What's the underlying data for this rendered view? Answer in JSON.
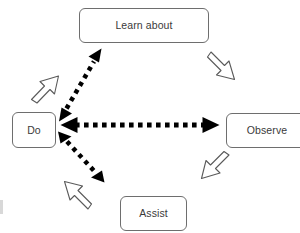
{
  "diagram": {
    "background_color": "#ffffff",
    "node_border_color": "#6e6e6e",
    "node_text_color": "#3a3a3a",
    "outline_arrow_color": "#5a5a5a",
    "dotted_arrow_color": "#000000",
    "nodes": [
      {
        "id": "learn",
        "label": "Learn about"
      },
      {
        "id": "observe",
        "label": "Observe"
      },
      {
        "id": "assist",
        "label": "Assist"
      },
      {
        "id": "do",
        "label": "Do"
      }
    ],
    "outline_arrows": [
      {
        "id": "do-to-learn",
        "from": "Do",
        "to": "Learn about",
        "direction": "up-right",
        "style": "hollow-block-arrow"
      },
      {
        "id": "learn-to-observe",
        "from": "Learn about",
        "to": "Observe",
        "direction": "down-right",
        "style": "hollow-block-arrow"
      },
      {
        "id": "observe-to-assist",
        "from": "Observe",
        "to": "Assist",
        "direction": "down-left",
        "style": "hollow-block-arrow"
      },
      {
        "id": "assist-to-do",
        "from": "Assist",
        "to": "Do",
        "direction": "up-left",
        "style": "hollow-block-arrow"
      }
    ],
    "dotted_arrows": [
      {
        "id": "do-learn-dotted",
        "between": [
          "Do",
          "Learn about"
        ],
        "style": "dotted-double-headed",
        "orientation": "diagonal-up-right"
      },
      {
        "id": "do-observe-dotted",
        "between": [
          "Do",
          "Observe"
        ],
        "style": "dotted-double-headed",
        "orientation": "horizontal"
      },
      {
        "id": "do-assist-dotted",
        "between": [
          "Do",
          "Assist"
        ],
        "style": "dotted-double-headed",
        "orientation": "diagonal-down-right"
      }
    ]
  }
}
